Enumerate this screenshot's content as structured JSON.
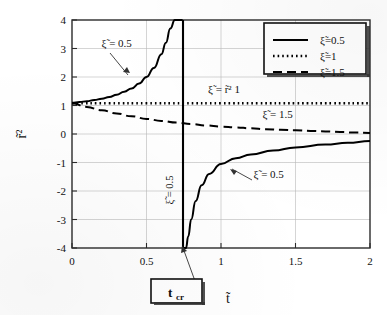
{
  "chart_data": {
    "type": "line",
    "title": "",
    "xlabel": "t̃",
    "ylabel": "r̃²",
    "xlim": [
      0,
      2
    ],
    "ylim": [
      -4,
      4
    ],
    "xticks": [
      "0",
      "0.5",
      "1",
      "1.5",
      "2"
    ],
    "xtick_values": [
      0,
      0.5,
      1,
      1.5,
      2
    ],
    "yticks": [
      "4",
      "3",
      "2",
      "1",
      "0",
      "-1",
      "-2",
      "-3",
      "-4"
    ],
    "ytick_values": [
      4,
      3,
      2,
      1,
      0,
      -1,
      -2,
      -3,
      -4
    ],
    "grid": true,
    "legend_position": "top-right",
    "series": [
      {
        "name": "ξ̃=0.5",
        "style": "solid",
        "color": "#000000",
        "x": [
          0.0,
          0.05,
          0.1,
          0.15,
          0.2,
          0.25,
          0.3,
          0.35,
          0.4,
          0.45,
          0.5,
          0.55,
          0.6,
          0.63,
          0.66,
          0.69,
          0.71,
          0.725,
          0.735,
          0.742,
          0.748,
          0.755,
          0.765,
          0.78,
          0.8,
          0.83,
          0.87,
          0.92,
          1.0,
          1.1,
          1.2,
          1.35,
          1.5,
          1.7,
          1.85,
          2.0
        ],
        "y": [
          1.1,
          1.12,
          1.15,
          1.19,
          1.24,
          1.3,
          1.38,
          1.48,
          1.6,
          1.77,
          2.0,
          2.32,
          2.8,
          3.2,
          3.7,
          4.0,
          4.0,
          4.0,
          4.0,
          4.0,
          -4.0,
          -4.0,
          -4.0,
          -3.6,
          -3.0,
          -2.35,
          -1.8,
          -1.4,
          -1.05,
          -0.85,
          -0.72,
          -0.58,
          -0.47,
          -0.37,
          -0.31,
          -0.25
        ]
      },
      {
        "name": "ξ̃=1",
        "style": "dotted",
        "color": "#000000",
        "x": [
          0.0,
          0.25,
          0.5,
          0.75,
          1.0,
          1.25,
          1.5,
          1.75,
          2.0
        ],
        "y": [
          1.08,
          1.08,
          1.08,
          1.08,
          1.08,
          1.08,
          1.08,
          1.08,
          1.08
        ]
      },
      {
        "name": "ξ̃=1.5",
        "style": "dashed",
        "color": "#000000",
        "x": [
          0.0,
          0.1,
          0.2,
          0.3,
          0.4,
          0.5,
          0.6,
          0.7,
          0.8,
          0.9,
          1.0,
          1.1,
          1.2,
          1.3,
          1.4,
          1.5,
          1.6,
          1.7,
          1.8,
          1.9,
          2.0
        ],
        "y": [
          1.08,
          0.95,
          0.83,
          0.72,
          0.62,
          0.53,
          0.46,
          0.4,
          0.35,
          0.3,
          0.26,
          0.23,
          0.2,
          0.17,
          0.15,
          0.13,
          0.11,
          0.09,
          0.07,
          0.05,
          0.04
        ]
      }
    ],
    "vertical_line": {
      "name": "t_cr-asymptote",
      "x": 0.745,
      "label": "ξ̃ = 0.5"
    },
    "annotations": [
      {
        "name": "annotation-upper-xi-05",
        "text": "ξ̃ = 0.5",
        "x": 0.3,
        "y": 3.05
      },
      {
        "name": "annotation-xi-r2-1",
        "text": "ξ̃ =   r̃² 1",
        "x": 1.02,
        "y": 1.45
      },
      {
        "name": "annotation-xi-15",
        "text": "ξ̃ = 1.5",
        "x": 1.38,
        "y": 0.55
      },
      {
        "name": "annotation-lower-xi-05",
        "text": "ξ̃ = 0.5",
        "x": 1.32,
        "y": -1.55
      }
    ],
    "callout_box": {
      "name": "t-cr-box",
      "text": "t",
      "subscript": "cr"
    }
  },
  "legend": {
    "items": [
      {
        "label": "ξ̃=0.5",
        "style": "solid"
      },
      {
        "label": "ξ̃=1",
        "style": "dotted"
      },
      {
        "label": "ξ̃=1.5",
        "style": "dashed"
      }
    ]
  }
}
